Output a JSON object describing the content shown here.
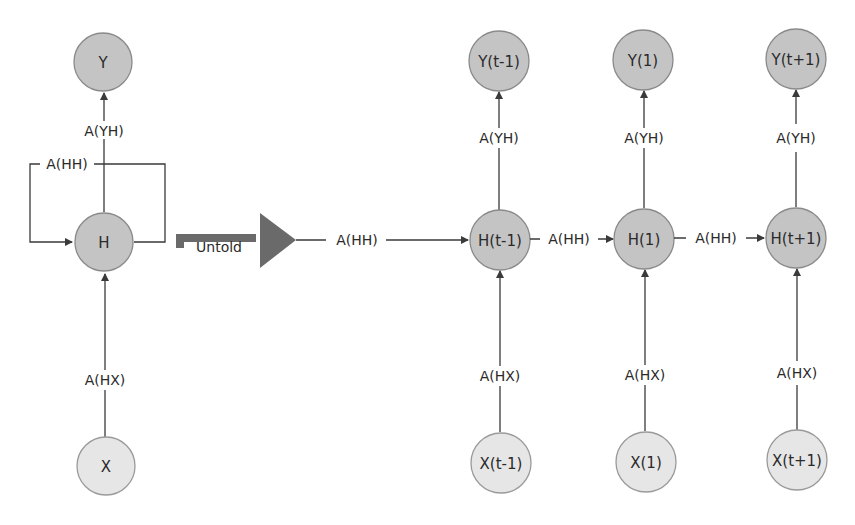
{
  "diagram": {
    "colors": {
      "hidden_output_node": "#c4c4c4",
      "input_node": "#e6e6e6",
      "edge": "#3a3a3a",
      "unfold_arrow": "#6a6a6a"
    },
    "folded": {
      "nodes": {
        "output": "Y",
        "hidden": "H",
        "input": "X"
      },
      "edges": {
        "hidden_to_output": "A(YH)",
        "recurrent": "A(HH)",
        "input_to_hidden": "A(HX)"
      }
    },
    "unfold_arrow": {
      "label": "Untold"
    },
    "unfolded": {
      "incoming_recurrent_label": "A(HH)",
      "steps": [
        {
          "output": "Y(t-1)",
          "hidden": "H(t-1)",
          "input": "X(t-1)",
          "output_weight": "A(YH)",
          "input_weight": "A(HX)"
        },
        {
          "output": "Y(1)",
          "hidden": "H(1)",
          "input": "X(1)",
          "output_weight": "A(YH)",
          "input_weight": "A(HX)"
        },
        {
          "output": "Y(t+1)",
          "hidden": "H(t+1)",
          "input": "X(t+1)",
          "output_weight": "A(YH)",
          "input_weight": "A(HX)"
        }
      ],
      "recurrent_weights": [
        "A(HH)",
        "A(HH)"
      ]
    }
  }
}
